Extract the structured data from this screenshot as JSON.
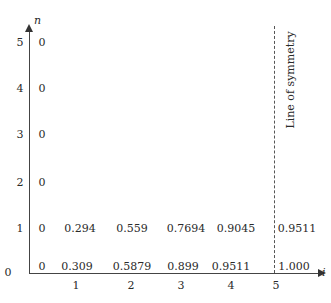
{
  "axes": {
    "y_label": "n",
    "x_label": "i",
    "y_ticks": [
      "0",
      "1",
      "2",
      "3",
      "4",
      "5"
    ],
    "x_ticks": [
      "1",
      "2",
      "3",
      "4",
      "5"
    ]
  },
  "symmetry_label": "Line of symmetry",
  "grid_values": {
    "row_5": [
      "0"
    ],
    "row_4": [
      "0"
    ],
    "row_3": [
      "0"
    ],
    "row_2": [
      "0"
    ],
    "row_1": [
      "0",
      "0.294",
      "0.559",
      "0.7694",
      "0.9045",
      "0.9511"
    ],
    "row_0": [
      "0",
      "0.309",
      "0.5879",
      "0.899",
      "0.9511",
      "1.000"
    ]
  }
}
